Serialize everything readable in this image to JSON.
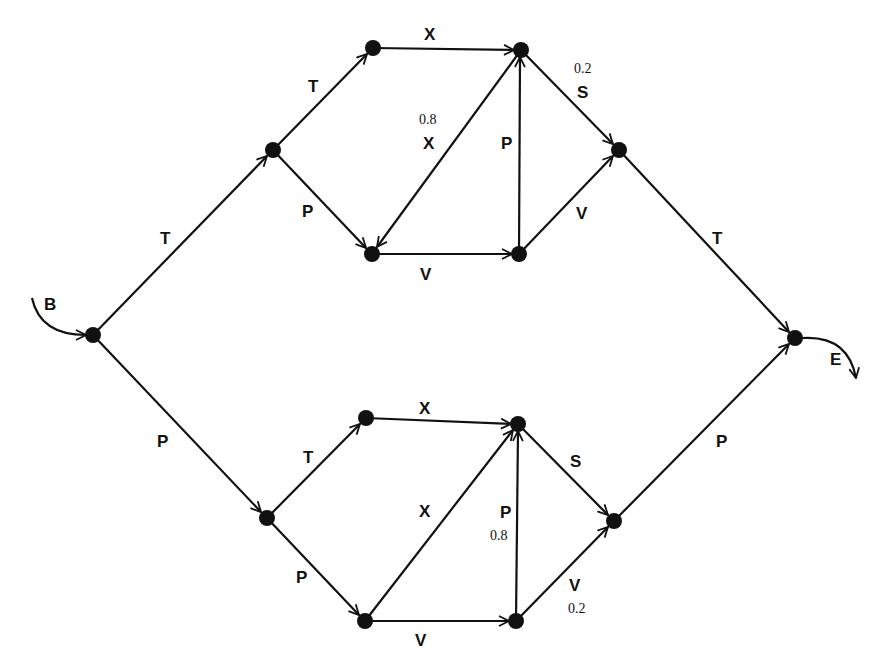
{
  "start_label": "B",
  "end_label": "E",
  "colors": {
    "ink": "#111111",
    "background": "#ffffff"
  },
  "nodes": [
    {
      "id": "start",
      "x": 93,
      "y": 335
    },
    {
      "id": "u1",
      "x": 273,
      "y": 150
    },
    {
      "id": "u2",
      "x": 373,
      "y": 48
    },
    {
      "id": "u3",
      "x": 521,
      "y": 50
    },
    {
      "id": "u4",
      "x": 372,
      "y": 254
    },
    {
      "id": "u5",
      "x": 519,
      "y": 254
    },
    {
      "id": "u6",
      "x": 619,
      "y": 150
    },
    {
      "id": "l1",
      "x": 267,
      "y": 518
    },
    {
      "id": "l2",
      "x": 366,
      "y": 418
    },
    {
      "id": "l3",
      "x": 518,
      "y": 424
    },
    {
      "id": "l4",
      "x": 365,
      "y": 621
    },
    {
      "id": "l5",
      "x": 516,
      "y": 621
    },
    {
      "id": "l6",
      "x": 614,
      "y": 521
    },
    {
      "id": "end",
      "x": 795,
      "y": 338
    }
  ],
  "edges": [
    {
      "from": "start",
      "to": "u1",
      "label": "T",
      "prob": ""
    },
    {
      "from": "u1",
      "to": "u2",
      "label": "T",
      "prob": ""
    },
    {
      "from": "u1",
      "to": "u4",
      "label": "P",
      "prob": ""
    },
    {
      "from": "u2",
      "to": "u3",
      "label": "X",
      "prob": ""
    },
    {
      "from": "u3",
      "to": "u4",
      "label": "X",
      "prob": "0.8"
    },
    {
      "from": "u3",
      "to": "u6",
      "label": "S",
      "prob": "0.2"
    },
    {
      "from": "u4",
      "to": "u5",
      "label": "V",
      "prob": ""
    },
    {
      "from": "u5",
      "to": "u3",
      "label": "P",
      "prob": ""
    },
    {
      "from": "u5",
      "to": "u6",
      "label": "V",
      "prob": ""
    },
    {
      "from": "u6",
      "to": "end",
      "label": "T",
      "prob": ""
    },
    {
      "from": "start",
      "to": "l1",
      "label": "P",
      "prob": ""
    },
    {
      "from": "l1",
      "to": "l2",
      "label": "T",
      "prob": ""
    },
    {
      "from": "l1",
      "to": "l4",
      "label": "P",
      "prob": ""
    },
    {
      "from": "l2",
      "to": "l3",
      "label": "X",
      "prob": ""
    },
    {
      "from": "l3",
      "to": "l4",
      "label": "X",
      "prob": ""
    },
    {
      "from": "l3",
      "to": "l6",
      "label": "S",
      "prob": ""
    },
    {
      "from": "l4",
      "to": "l5",
      "label": "V",
      "prob": ""
    },
    {
      "from": "l5",
      "to": "l3",
      "label": "P",
      "prob": "0.8"
    },
    {
      "from": "l5",
      "to": "l6",
      "label": "V",
      "prob": "0.2"
    },
    {
      "from": "l6",
      "to": "end",
      "label": "P",
      "prob": ""
    }
  ],
  "labels": {
    "b": "B",
    "e": "E",
    "start_u1": "T",
    "u1_u2": "T",
    "u1_u4": "P",
    "u2_u3": "X",
    "u3_u4": "X",
    "u3_u4_prob": "0.8",
    "u3_u6": "S",
    "u3_u6_prob": "0.2",
    "u5_u3": "P",
    "u4_u5": "V",
    "u5_u6": "V",
    "u6_end": "T",
    "start_l1": "P",
    "l1_l2": "T",
    "l1_l4": "P",
    "l2_l3": "X",
    "l3_l4": "X",
    "l3_l6": "S",
    "l5_l3": "P",
    "l5_l3_prob": "0.8",
    "l4_l5": "V",
    "l5_l6": "V",
    "l5_l6_prob": "0.2",
    "l6_end": "P"
  }
}
